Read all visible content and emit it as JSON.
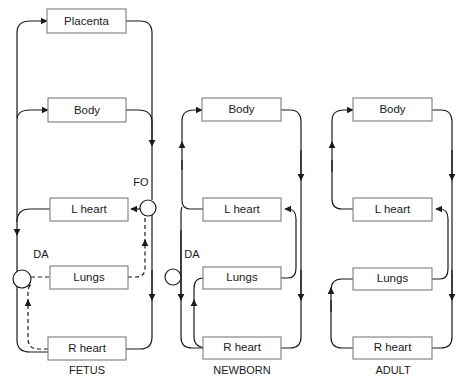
{
  "diagram": {
    "stroke_color": "#1a1a1a",
    "box_stroke_color": "#7d7d7d",
    "background_color": "#ffffff",
    "panels": [
      {
        "id": "fetus",
        "caption": "FETUS",
        "caption_x": 87,
        "caption_y": 371,
        "nodes": [
          {
            "id": "placenta",
            "label": "Placenta",
            "x": 47,
            "y": 9,
            "w": 79,
            "h": 24
          },
          {
            "id": "body",
            "label": "Body",
            "x": 48,
            "y": 98,
            "w": 78,
            "h": 24
          },
          {
            "id": "lheart",
            "label": "L heart",
            "x": 50,
            "y": 198,
            "w": 78,
            "h": 23
          },
          {
            "id": "lungs",
            "label": "Lungs",
            "x": 50,
            "y": 266,
            "w": 78,
            "h": 23
          },
          {
            "id": "rheart",
            "label": "R heart",
            "x": 48,
            "y": 337,
            "w": 78,
            "h": 23
          }
        ],
        "shunts": [
          {
            "id": "fo",
            "label": "FO",
            "cx": 148,
            "cy": 208,
            "r": 8,
            "label_x": 141,
            "label_y": 183
          },
          {
            "id": "da",
            "label": "DA",
            "cx": 22,
            "cy": 279,
            "r": 9,
            "label_x": 41,
            "label_y": 255
          }
        ]
      },
      {
        "id": "newborn",
        "caption": "NEWBORN",
        "caption_x": 242,
        "caption_y": 371,
        "nodes": [
          {
            "id": "body",
            "label": "Body",
            "x": 202,
            "y": 98,
            "w": 79,
            "h": 23
          },
          {
            "id": "lheart",
            "label": "L heart",
            "x": 203,
            "y": 198,
            "w": 78,
            "h": 23
          },
          {
            "id": "lungs",
            "label": "Lungs",
            "x": 203,
            "y": 267,
            "w": 78,
            "h": 22
          },
          {
            "id": "rheart",
            "label": "R heart",
            "x": 203,
            "y": 337,
            "w": 78,
            "h": 22
          }
        ],
        "shunts": [
          {
            "id": "da",
            "label": "DA",
            "cx": 173,
            "cy": 277,
            "r": 8,
            "label_x": 192,
            "label_y": 255
          }
        ]
      },
      {
        "id": "adult",
        "caption": "ADULT",
        "caption_x": 393,
        "caption_y": 371,
        "nodes": [
          {
            "id": "body",
            "label": "Body",
            "x": 353,
            "y": 98,
            "w": 79,
            "h": 23
          },
          {
            "id": "lheart",
            "label": "L heart",
            "x": 353,
            "y": 198,
            "w": 79,
            "h": 23
          },
          {
            "id": "lungs",
            "label": "Lungs",
            "x": 353,
            "y": 268,
            "w": 79,
            "h": 22
          },
          {
            "id": "rheart",
            "label": "R heart",
            "x": 353,
            "y": 337,
            "w": 79,
            "h": 22
          }
        ],
        "shunts": []
      }
    ]
  }
}
